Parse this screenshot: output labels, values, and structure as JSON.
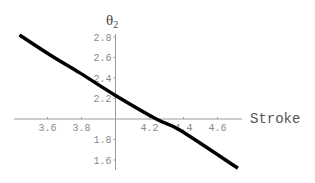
{
  "chart_data": {
    "type": "line",
    "title": "",
    "xlabel": "Stroke",
    "ylabel": "θ2",
    "ylabel_main": "θ",
    "ylabel_sub": "2",
    "xlim": [
      3.43,
      4.75
    ],
    "ylim": [
      1.5,
      2.85
    ],
    "axes_origin": [
      4.0,
      2.0
    ],
    "x_ticks": [
      3.6,
      3.8,
      4.2,
      4.4,
      4.6
    ],
    "x_tick_labels": [
      "3.6",
      "3.8",
      "4.2",
      "4.4",
      "4.6"
    ],
    "y_ticks": [
      2.8,
      2.6,
      2.4,
      2.2,
      1.8,
      1.6
    ],
    "y_tick_labels": [
      "2.8",
      "2.6",
      "2.4",
      "2.2",
      "1.8",
      "1.6"
    ],
    "grid": false,
    "legend": null,
    "series": [
      {
        "name": "θ2 vs Stroke",
        "color": "#000000",
        "x": [
          3.435,
          3.62,
          3.79,
          4.0,
          4.24,
          4.38,
          4.72
        ],
        "y": [
          2.82,
          2.62,
          2.45,
          2.23,
          2.0,
          1.89,
          1.52
        ]
      }
    ]
  }
}
